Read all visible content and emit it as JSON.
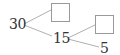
{
  "diagram": {
    "type": "factor-tree",
    "root": {
      "value": "30",
      "children": [
        {
          "value": "",
          "kind": "empty-box"
        },
        {
          "value": "15",
          "children": [
            {
              "value": "",
              "kind": "empty-box"
            },
            {
              "value": "5"
            }
          ]
        }
      ]
    },
    "labels": {
      "root": "30",
      "mid": "15",
      "leaf": "5"
    },
    "colors": {
      "line": "#b0b0b0",
      "box_border": "#9a9a9a",
      "text": "#333333"
    }
  }
}
